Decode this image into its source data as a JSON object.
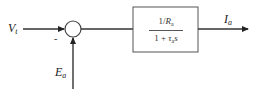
{
  "diagram": {
    "type": "block-diagram",
    "colors": {
      "line": "#333333",
      "background": "#ffffff"
    },
    "inputs": [
      {
        "id": "vt",
        "symbol": "V",
        "subscript": "t",
        "sign": ""
      },
      {
        "id": "ea",
        "symbol": "E",
        "subscript": "a",
        "sign": "-"
      }
    ],
    "summing_junction": {
      "minus_label": "-"
    },
    "transfer_block": {
      "numerator": {
        "prefix": "1/",
        "symbol": "R",
        "subscript": "a"
      },
      "denominator": {
        "prefix": "1 + ",
        "symbol": "τ",
        "subscript": "a",
        "suffix": "s"
      }
    },
    "output": {
      "symbol": "I",
      "subscript": "a"
    }
  }
}
